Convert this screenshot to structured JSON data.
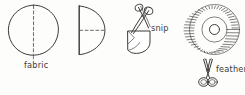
{
  "figure": {
    "background_color": "#fdfdfc",
    "ink_color": "#3a3a38",
    "style": "hand-drawn line illustration"
  },
  "labels": {
    "fabric": "fabric",
    "snip": "snip",
    "feather": "feather"
  },
  "steps": [
    {
      "id": "step-1",
      "name": "fabric-circle",
      "shape": "circle",
      "annotation": "vertical dashed fold line",
      "label": "fabric"
    },
    {
      "id": "step-2",
      "name": "folded-half-circle",
      "shape": "half-circle",
      "annotation": "horizontal dashed fold line",
      "label": ""
    },
    {
      "id": "step-3",
      "name": "snip-wedge",
      "shape": "folded-wedge",
      "annotation": "scissors cutting fringe",
      "label": "snip"
    },
    {
      "id": "step-4",
      "name": "fringed-pompom",
      "shape": "radial-fringe-circle",
      "annotation": "opened fringed circle with center hole",
      "label": ""
    },
    {
      "id": "step-5",
      "name": "feather-scissors",
      "shape": "scissors",
      "annotation": "upright scissors",
      "label": "feather"
    }
  ],
  "icons": {
    "scissors_diagonal": "scissors-icon",
    "scissors_upright": "scissors-icon"
  }
}
